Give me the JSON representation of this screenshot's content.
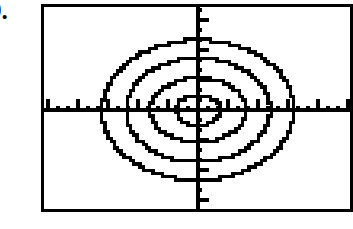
{
  "problem": {
    "number_label": "9."
  },
  "calculator_screen": {
    "frame": {
      "border_color": "#000000",
      "background_color": "#ffffff",
      "border_width_px": 3,
      "x": 41,
      "y": 4,
      "width": 312,
      "height": 208
    },
    "ink_color": "#000000"
  },
  "chart_data": {
    "type": "line",
    "title": "",
    "subtitle": "",
    "xlabel": "",
    "ylabel": "",
    "render_style": "pixelated-calculator-screen",
    "grid": false,
    "legend": null,
    "legend_position": "none",
    "axes": {
      "x_axis": {
        "visible": true,
        "screen_y": 110,
        "tick_spacing_px": 10,
        "major_tick_spacing_px": 30,
        "tick_length_minor_px": 4,
        "tick_length_major_px": 11,
        "ticks_direction": "up",
        "tick_labels": [],
        "xlim": [
          -14.5,
          14.5
        ]
      },
      "y_axis": {
        "visible": true,
        "screen_x": 198,
        "tick_spacing_px": 10,
        "major_tick_spacing_px": 30,
        "tick_length_minor_px": 4,
        "tick_length_major_px": 11,
        "ticks_direction": "right",
        "tick_labels": [],
        "ylim": [
          -10.2,
          10.2
        ]
      }
    },
    "center": {
      "x": 198,
      "y": 110
    },
    "series": [
      {
        "name": "ellipse-1-innermost",
        "type": "ellipse",
        "semi_axis_x_px": 22,
        "semi_axis_y_px": 15,
        "semi_axis_x_units": 2,
        "semi_axis_y_units": 1.4
      },
      {
        "name": "ellipse-2",
        "type": "ellipse",
        "semi_axis_x_px": 48,
        "semi_axis_y_px": 32,
        "semi_axis_x_units": 4,
        "semi_axis_y_units": 3
      },
      {
        "name": "ellipse-3",
        "type": "ellipse",
        "semi_axis_x_px": 72,
        "semi_axis_y_px": 52,
        "semi_axis_x_units": 6,
        "semi_axis_y_units": 4.8
      },
      {
        "name": "ellipse-4-outermost",
        "type": "ellipse",
        "semi_axis_x_px": 96,
        "semi_axis_y_px": 70,
        "semi_axis_x_units": 8,
        "semi_axis_y_units": 6.5
      }
    ]
  }
}
